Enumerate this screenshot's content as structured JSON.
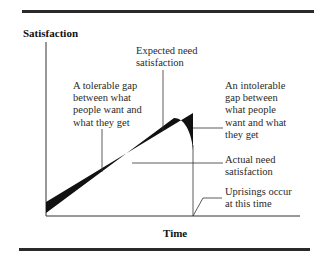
{
  "figure": {
    "y_axis_label": "Satisfaction",
    "x_axis_label": "Time",
    "annotations": {
      "expected": "Expected need\nsatisfaction",
      "tolerable": "A tolerable gap\nbetween what\npeople want and\nwhat they get",
      "intolerable": "An intolerable\ngap between\nwhat people\nwant and what\nthey get",
      "actual": "Actual need\nsatisfaction",
      "uprisings": "Uprisings occur\nat this time"
    },
    "colors": {
      "ink": "#111111",
      "rule": "#2a2a2a"
    }
  }
}
